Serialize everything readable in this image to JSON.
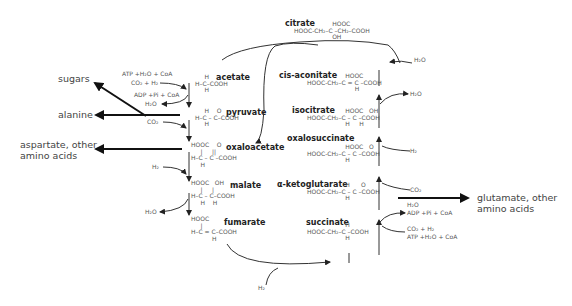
{
  "diagram": {
    "type": "metabolic-pathway",
    "left_branch": [
      {
        "id": "acetate",
        "name": "acetate",
        "structure": "     H\nH–C–COOH\n     H"
      },
      {
        "id": "pyruvate",
        "name": "pyruvate",
        "structure": "     H    O\nH–C – C–COOH\n     H"
      },
      {
        "id": "oxaloacetate",
        "name": "oxaloacetate",
        "structure": "HOOC    O\n     |     ||\nH–C – C –COOH\n     H"
      },
      {
        "id": "malate",
        "name": "malate",
        "structure": "HOOC   OH\n     |     |\nH–C – C–COOH\n     H    H"
      },
      {
        "id": "fumarate",
        "name": "fumarate",
        "structure": "HOOC\n     |\nH–C = C–COOH\n           H"
      }
    ],
    "right_branch": [
      {
        "id": "citrate",
        "name": "citrate",
        "structure": "                    HOOC\nHOOC-CH₂–C –CH₂–COOH\n                    OH"
      },
      {
        "id": "cis-aconitate",
        "name": "cis-aconitate",
        "structure": "                    HOOC\nHOOC-CH₂–C = C –COOH\n                         H"
      },
      {
        "id": "isocitrate",
        "name": "isocitrate",
        "structure": "                    HOOC   OH\nHOOC-CH₂–C – C –COOH\n                    H     H"
      },
      {
        "id": "oxalosuccinate",
        "name": "oxalosuccinate",
        "structure": "                    HOOC   O\nHOOC-CH₂–C – C –COOH\n                    H"
      },
      {
        "id": "alpha-ketoglutarate",
        "name": "α-ketoglutarate",
        "structure": "                    H      O\nHOOC-CH₂–C – C –COOH\n                    H"
      },
      {
        "id": "succinate",
        "name": "succinate",
        "structure": "                    H\nHOOC-CH₂–C –COOH\n                    H"
      }
    ],
    "cofactors": {
      "acetate_in_1": "ATP +H₂O + CoA",
      "acetate_in_2": "CO₂ + H₂",
      "acetate_out": "ADP +Pi + CoA",
      "acetate_out_h2o": "H₂O",
      "pyruvate_in": "CO₂",
      "oxaloacetate_in": "H₂",
      "malate_out": "H₂O",
      "fumarate_to_succinate_in": "H₂",
      "succinate_in_1": "CO₂ + H₂",
      "succinate_in_2": "ATP +H₂O + CoA",
      "succinate_out_1": "H₂O",
      "succinate_out_2": "ADP +Pi + CoA",
      "akg_in": "CO₂",
      "oxalosuccinate_in": "H₂",
      "isocitrate_out": "H₂O",
      "citrate_in": "H₂O"
    },
    "outputs": {
      "sugars": "sugars",
      "alanine": "alanine",
      "aspartate_1": "aspartate, other",
      "aspartate_2": "amino acids",
      "glutamate_1": "glutamate, other",
      "glutamate_2": "amino acids"
    }
  }
}
